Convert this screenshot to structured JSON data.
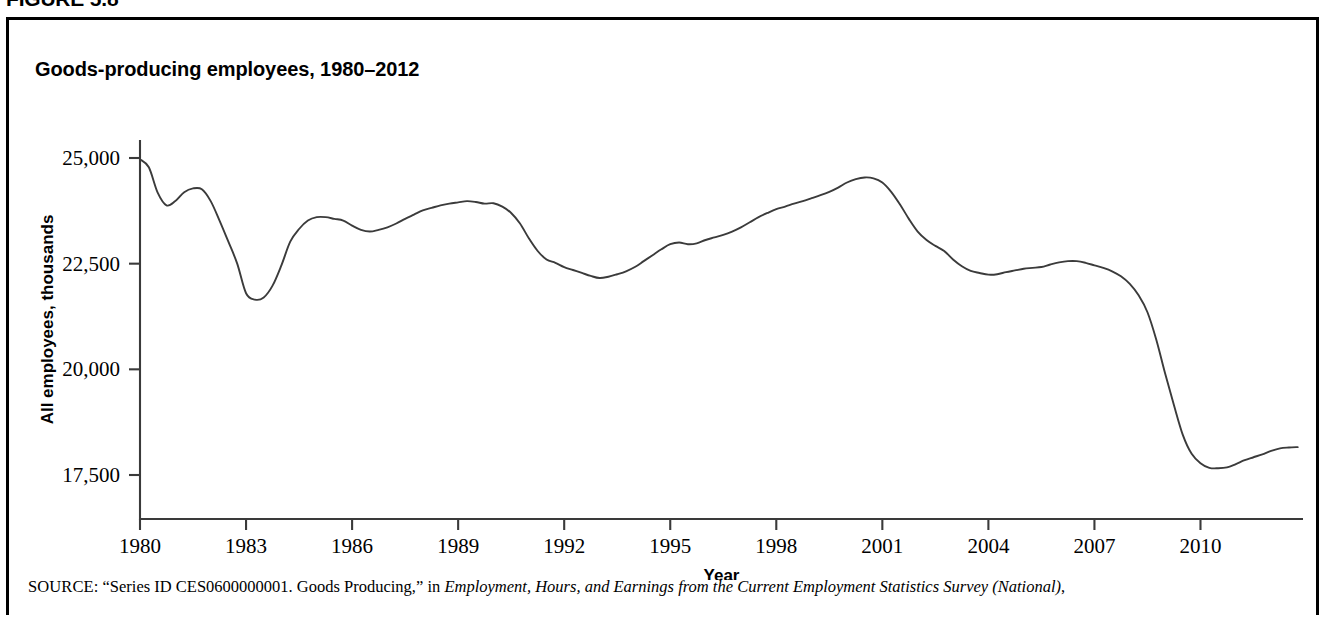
{
  "figure": {
    "number_label": "FIGURE 5.8"
  },
  "chart_title": "Goods-producing employees, 1980–2012",
  "source": {
    "prefix": "SOURCE:",
    "quoted": "“Series ID CES0600000001. Goods Producing,” in ",
    "italic_publication": "Employment, Hours, and Earnings from the Current Employment Statistics Survey (National)",
    "suffix": ","
  },
  "chart_data": {
    "type": "line",
    "title": "Goods-producing employees, 1980–2012",
    "xlabel": "Year",
    "ylabel": "All employees, thousands",
    "xlim": [
      1980,
      2012.9
    ],
    "ylim": [
      17000,
      25200
    ],
    "grid": false,
    "legend": null,
    "xticks": [
      1980,
      1983,
      1986,
      1989,
      1992,
      1995,
      1998,
      2001,
      2004,
      2007,
      2010
    ],
    "xtick_labels": [
      "1980",
      "1983",
      "1986",
      "1989",
      "1992",
      "1995",
      "1998",
      "2001",
      "2004",
      "2007",
      "2010"
    ],
    "yticks": [
      17500,
      20000,
      22500,
      25000
    ],
    "ytick_labels": [
      "17,500",
      "20,000",
      "22,500",
      "25,000"
    ],
    "series": [
      {
        "name": "Goods-producing employees",
        "color": "#3b3b3b",
        "x": [
          1980.0,
          1980.25,
          1980.5,
          1980.75,
          1981.0,
          1981.25,
          1981.5,
          1981.75,
          1982.0,
          1982.25,
          1982.5,
          1982.75,
          1983.0,
          1983.25,
          1983.5,
          1983.75,
          1984.0,
          1984.25,
          1984.5,
          1984.75,
          1985.0,
          1985.25,
          1985.5,
          1985.75,
          1986.0,
          1986.25,
          1986.5,
          1986.75,
          1987.0,
          1987.25,
          1987.5,
          1987.75,
          1988.0,
          1988.25,
          1988.5,
          1988.75,
          1989.0,
          1989.25,
          1989.5,
          1989.75,
          1990.0,
          1990.25,
          1990.5,
          1990.75,
          1991.0,
          1991.25,
          1991.5,
          1991.75,
          1992.0,
          1992.25,
          1992.5,
          1992.75,
          1993.0,
          1993.25,
          1993.5,
          1993.75,
          1994.0,
          1994.25,
          1994.5,
          1994.75,
          1995.0,
          1995.25,
          1995.5,
          1995.75,
          1996.0,
          1996.25,
          1996.5,
          1996.75,
          1997.0,
          1997.25,
          1997.5,
          1997.75,
          1998.0,
          1998.25,
          1998.5,
          1998.75,
          1999.0,
          1999.25,
          1999.5,
          1999.75,
          2000.0,
          2000.25,
          2000.5,
          2000.75,
          2001.0,
          2001.25,
          2001.5,
          2001.75,
          2002.0,
          2002.25,
          2002.5,
          2002.75,
          2003.0,
          2003.25,
          2003.5,
          2003.75,
          2004.0,
          2004.25,
          2004.5,
          2004.75,
          2005.0,
          2005.25,
          2005.5,
          2005.75,
          2006.0,
          2006.25,
          2006.5,
          2006.75,
          2007.0,
          2007.25,
          2007.5,
          2007.75,
          2008.0,
          2008.25,
          2008.5,
          2008.75,
          2009.0,
          2009.25,
          2009.5,
          2009.75,
          2010.0,
          2010.25,
          2010.5,
          2010.75,
          2011.0,
          2011.25,
          2011.5,
          2011.75,
          2012.0,
          2012.25,
          2012.5,
          2012.75
        ],
        "y": [
          24970,
          24780,
          24180,
          23880,
          23980,
          24190,
          24280,
          24260,
          23980,
          23520,
          23020,
          22500,
          21800,
          21650,
          21700,
          21980,
          22460,
          23020,
          23320,
          23520,
          23600,
          23600,
          23560,
          23520,
          23400,
          23300,
          23260,
          23300,
          23360,
          23450,
          23560,
          23660,
          23760,
          23820,
          23880,
          23920,
          23950,
          23980,
          23960,
          23920,
          23930,
          23850,
          23700,
          23450,
          23100,
          22800,
          22600,
          22520,
          22420,
          22350,
          22280,
          22210,
          22160,
          22190,
          22250,
          22320,
          22420,
          22560,
          22700,
          22840,
          22960,
          23000,
          22960,
          22980,
          23060,
          23120,
          23180,
          23260,
          23360,
          23480,
          23600,
          23700,
          23790,
          23850,
          23920,
          23980,
          24050,
          24120,
          24200,
          24300,
          24420,
          24500,
          24540,
          24520,
          24420,
          24200,
          23900,
          23560,
          23260,
          23060,
          22920,
          22800,
          22600,
          22440,
          22330,
          22280,
          22240,
          22250,
          22300,
          22340,
          22380,
          22400,
          22420,
          22480,
          22530,
          22560,
          22560,
          22520,
          22460,
          22400,
          22320,
          22200,
          22020,
          21750,
          21350,
          20700,
          19900,
          19150,
          18450,
          18000,
          17780,
          17670,
          17660,
          17680,
          17760,
          17850,
          17920,
          17990,
          18070,
          18130,
          18150,
          18160
        ]
      }
    ]
  },
  "axis_labels": {
    "x_axis_title": "Year",
    "y_axis_title": "All employees, thousands"
  }
}
